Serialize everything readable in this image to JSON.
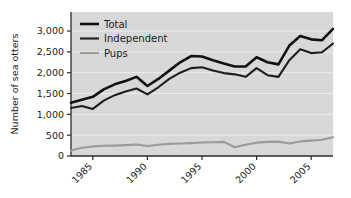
{
  "chart_data": {
    "type": "line",
    "title": "",
    "subtitle": "",
    "xlabel": "",
    "ylabel": "Number of sea otters",
    "xlim": [
      1983,
      2007
    ],
    "ylim": [
      0,
      3250
    ],
    "ytick_values": [
      0,
      500,
      1000,
      1500,
      2000,
      2500,
      3000
    ],
    "ytick_labels": [
      "0",
      "500",
      "1,000",
      "1,500",
      "2,000",
      "2,500",
      "3,000"
    ],
    "xtick_values": [
      1985,
      1990,
      1995,
      2000,
      2005
    ],
    "xtick_labels": [
      "1985",
      "1990",
      "1995",
      "2000",
      "2005"
    ],
    "grid": true,
    "grid_axis": "y",
    "legend_position": "top-left",
    "x": [
      1983,
      1984,
      1985,
      1986,
      1987,
      1988,
      1989,
      1990,
      1991,
      1992,
      1993,
      1994,
      1995,
      1996,
      1997,
      1998,
      1999,
      2000,
      2001,
      2002,
      2003,
      2004,
      2005,
      2006,
      2007
    ],
    "series": [
      {
        "name": "Total",
        "color": "#111111",
        "values": [
          1280,
          1350,
          1420,
          1600,
          1720,
          1800,
          1900,
          1680,
          1850,
          2050,
          2250,
          2400,
          2390,
          2300,
          2220,
          2150,
          2150,
          2370,
          2250,
          2200,
          2650,
          2880,
          2800,
          2780,
          3050
        ]
      },
      {
        "name": "Independent",
        "color": "#1e1e1e",
        "values": [
          1150,
          1200,
          1130,
          1330,
          1460,
          1550,
          1620,
          1480,
          1650,
          1850,
          2000,
          2110,
          2130,
          2050,
          1990,
          1960,
          1900,
          2110,
          1940,
          1900,
          2300,
          2560,
          2470,
          2490,
          2700
        ]
      },
      {
        "name": "Pups",
        "color": "#9a9a9a",
        "values": [
          130,
          200,
          230,
          245,
          250,
          260,
          275,
          240,
          270,
          290,
          300,
          310,
          325,
          330,
          340,
          210,
          270,
          320,
          340,
          345,
          300,
          350,
          370,
          390,
          450
        ]
      }
    ]
  },
  "legend": {
    "items": [
      {
        "label": "Total"
      },
      {
        "label": "Independent"
      },
      {
        "label": "Pups"
      }
    ]
  },
  "colors": {
    "plot_background": "#d8d8d8",
    "gridline": "#ededed",
    "axis": "#2b2b2b",
    "text": "#1c1c1c"
  }
}
